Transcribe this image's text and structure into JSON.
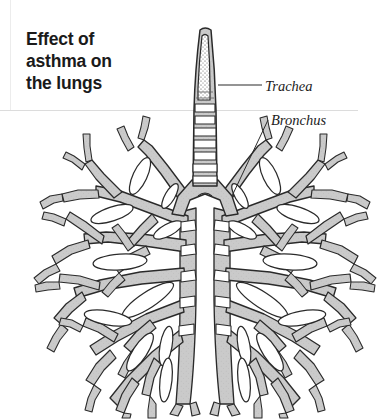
{
  "figure": {
    "title": "Effect of\nasthma on\nthe lungs",
    "title_lines": [
      "Effect of",
      "asthma on",
      "the lungs"
    ],
    "background_color": "#ffffff",
    "rule_color": "#d8d8d8",
    "ink_color": "#1a1a1a",
    "tissue_fill": "#c9c9c9",
    "lumen_fill": "#ffffff"
  },
  "labels": {
    "trachea": "Trachea",
    "bronchus": "Bronchus"
  },
  "anatomy": {
    "trachea_name": "trachea",
    "bronchus_name": "bronchus",
    "left_lung_name": "left-lung-bronchial-tree",
    "right_lung_name": "right-lung-bronchial-tree",
    "carina_name": "carina"
  }
}
